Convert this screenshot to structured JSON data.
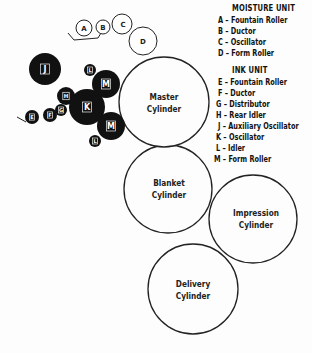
{
  "legend": {
    "moisture_title": "MOISTURE UNIT",
    "moisture_items": [
      "A – Fountain Roller",
      "B – Ductor",
      "C – Oscillator",
      "D – Form Roller"
    ],
    "ink_title": "INK UNIT",
    "ink_items": [
      "E – Fountain Roller",
      "F – Ductor",
      "G – Distributor",
      "H – Rear Idler",
      "J – Auxiliary Oscillator",
      "K – Oscillator",
      "L – Idler",
      "M – Form Roller"
    ]
  },
  "rollers": {
    "moisture": [
      {
        "id": "A",
        "label": "A"
      },
      {
        "id": "B",
        "label": "B"
      },
      {
        "id": "C",
        "label": "C"
      },
      {
        "id": "D",
        "label": "D"
      }
    ],
    "ink": [
      {
        "id": "J",
        "label": "J"
      },
      {
        "id": "L1",
        "label": "L"
      },
      {
        "id": "M1",
        "label": "M"
      },
      {
        "id": "H",
        "label": "H"
      },
      {
        "id": "K",
        "label": "K"
      },
      {
        "id": "M2",
        "label": "M"
      },
      {
        "id": "L2",
        "label": "L"
      },
      {
        "id": "G",
        "label": "G"
      },
      {
        "id": "F",
        "label": "F"
      },
      {
        "id": "E",
        "label": "E"
      }
    ]
  },
  "cylinders": {
    "master": [
      "Master",
      "Cylinder"
    ],
    "blanket": [
      "Blanket",
      "Cylinder"
    ],
    "impression": [
      "Impression",
      "Cylinder"
    ],
    "delivery": [
      "Delivery",
      "Cylinder"
    ]
  },
  "colors": {
    "ink": "#111111",
    "outline": "#222222",
    "background": "#fdfdfd"
  }
}
